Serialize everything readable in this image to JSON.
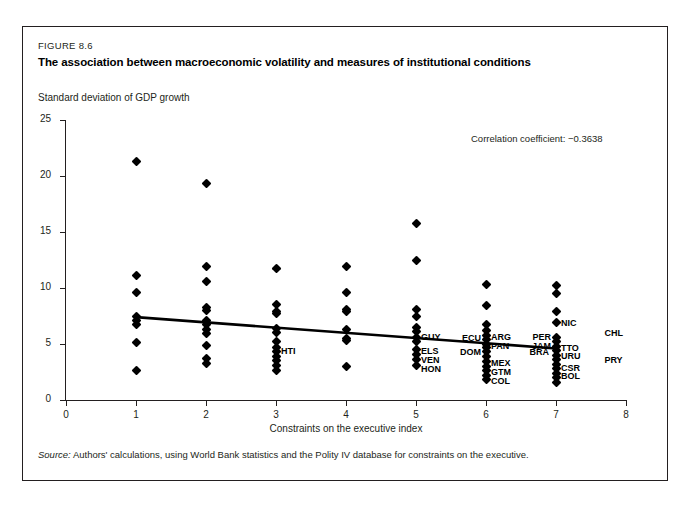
{
  "figure": {
    "number": "FIGURE 8.6",
    "title": "The association between macroeconomic volatility and measures of institutional conditions",
    "source": "Authors' calculations, using World Bank statistics and the Polity IV database for constraints on the executive.",
    "source_label": "Source:"
  },
  "chart_data": {
    "type": "scatter",
    "title": "The association between macroeconomic volatility and measures of institutional conditions",
    "subtitle": "",
    "xlabel": "Constraints on the executive index",
    "ylabel": "Standard deviation of GDP growth",
    "xlim": [
      0,
      8
    ],
    "ylim": [
      0,
      25
    ],
    "xticks": [
      0,
      1,
      2,
      3,
      4,
      5,
      6,
      7,
      8
    ],
    "yticks": [
      0,
      5,
      10,
      15,
      20,
      25
    ],
    "grid": false,
    "legend": "none",
    "annotation": "Correlation coefficient: −0.3638",
    "correlation_coefficient": -0.3638,
    "marker": "diamond",
    "marker_color": "#000000",
    "trendline": {
      "type": "linear",
      "x": [
        1,
        7
      ],
      "y": [
        7.4,
        4.6
      ],
      "color": "#000000"
    },
    "points": [
      {
        "x": 1,
        "y": 21.3
      },
      {
        "x": 1,
        "y": 11.1
      },
      {
        "x": 1,
        "y": 9.6
      },
      {
        "x": 1,
        "y": 7.5
      },
      {
        "x": 1,
        "y": 7.1
      },
      {
        "x": 1,
        "y": 6.7
      },
      {
        "x": 1,
        "y": 5.1
      },
      {
        "x": 1,
        "y": 2.6
      },
      {
        "x": 2,
        "y": 19.3
      },
      {
        "x": 2,
        "y": 11.9
      },
      {
        "x": 2,
        "y": 10.6
      },
      {
        "x": 2,
        "y": 8.3
      },
      {
        "x": 2,
        "y": 8.0
      },
      {
        "x": 2,
        "y": 7.1
      },
      {
        "x": 2,
        "y": 6.7
      },
      {
        "x": 2,
        "y": 6.3
      },
      {
        "x": 2,
        "y": 5.9
      },
      {
        "x": 2,
        "y": 4.9
      },
      {
        "x": 2,
        "y": 3.7
      },
      {
        "x": 2,
        "y": 3.3
      },
      {
        "x": 3,
        "y": 11.7
      },
      {
        "x": 3,
        "y": 8.5
      },
      {
        "x": 3,
        "y": 7.9
      },
      {
        "x": 3,
        "y": 7.7
      },
      {
        "x": 3,
        "y": 6.4
      },
      {
        "x": 3,
        "y": 6.0
      },
      {
        "x": 3,
        "y": 5.2
      },
      {
        "x": 3,
        "y": 4.7
      },
      {
        "x": 3,
        "y": 4.3
      },
      {
        "x": 3,
        "y": 3.9
      },
      {
        "x": 3,
        "y": 3.5
      },
      {
        "x": 3,
        "y": 3.1
      },
      {
        "x": 3,
        "y": 2.6
      },
      {
        "x": 4,
        "y": 11.9
      },
      {
        "x": 4,
        "y": 9.6
      },
      {
        "x": 4,
        "y": 8.1
      },
      {
        "x": 4,
        "y": 7.9
      },
      {
        "x": 4,
        "y": 6.3
      },
      {
        "x": 4,
        "y": 5.5
      },
      {
        "x": 4,
        "y": 5.3
      },
      {
        "x": 4,
        "y": 3.0
      },
      {
        "x": 5,
        "y": 15.8
      },
      {
        "x": 5,
        "y": 12.5
      },
      {
        "x": 5,
        "y": 8.1
      },
      {
        "x": 5,
        "y": 7.5
      },
      {
        "x": 5,
        "y": 6.5
      },
      {
        "x": 5,
        "y": 6.1
      },
      {
        "x": 5,
        "y": 5.6
      },
      {
        "x": 5,
        "y": 5.2
      },
      {
        "x": 5,
        "y": 4.5
      },
      {
        "x": 5,
        "y": 4.1
      },
      {
        "x": 5,
        "y": 3.6
      },
      {
        "x": 5,
        "y": 3.1
      },
      {
        "x": 6,
        "y": 10.3
      },
      {
        "x": 6,
        "y": 8.4
      },
      {
        "x": 6,
        "y": 6.7
      },
      {
        "x": 6,
        "y": 6.2
      },
      {
        "x": 6,
        "y": 5.8
      },
      {
        "x": 6,
        "y": 5.4
      },
      {
        "x": 6,
        "y": 5.0
      },
      {
        "x": 6,
        "y": 4.7
      },
      {
        "x": 6,
        "y": 4.3
      },
      {
        "x": 6,
        "y": 3.9
      },
      {
        "x": 6,
        "y": 3.4
      },
      {
        "x": 6,
        "y": 3.0
      },
      {
        "x": 6,
        "y": 2.6
      },
      {
        "x": 6,
        "y": 2.2
      },
      {
        "x": 6,
        "y": 1.8
      },
      {
        "x": 7,
        "y": 10.2
      },
      {
        "x": 7,
        "y": 9.5
      },
      {
        "x": 7,
        "y": 7.9
      },
      {
        "x": 7,
        "y": 6.9
      },
      {
        "x": 7,
        "y": 5.6
      },
      {
        "x": 7,
        "y": 5.2
      },
      {
        "x": 7,
        "y": 4.8
      },
      {
        "x": 7,
        "y": 4.4
      },
      {
        "x": 7,
        "y": 4.0
      },
      {
        "x": 7,
        "y": 3.6
      },
      {
        "x": 7,
        "y": 3.2
      },
      {
        "x": 7,
        "y": 2.8
      },
      {
        "x": 7,
        "y": 2.4
      },
      {
        "x": 7,
        "y": 2.0
      },
      {
        "x": 7,
        "y": 1.6
      }
    ],
    "country_labels": [
      {
        "code": "HTI",
        "x": 3,
        "y": 4.4,
        "align": "right"
      },
      {
        "code": "GUY",
        "x": 5,
        "y": 5.6,
        "align": "right"
      },
      {
        "code": "ELS",
        "x": 5,
        "y": 4.4,
        "align": "right"
      },
      {
        "code": "VEN",
        "x": 5,
        "y": 3.6,
        "align": "right"
      },
      {
        "code": "HON",
        "x": 5,
        "y": 2.8,
        "align": "right"
      },
      {
        "code": "ECU",
        "x": 6,
        "y": 5.5,
        "align": "left"
      },
      {
        "code": "DOM",
        "x": 6,
        "y": 4.3,
        "align": "left"
      },
      {
        "code": "ARG",
        "x": 6,
        "y": 5.6,
        "align": "right"
      },
      {
        "code": "PAN",
        "x": 6,
        "y": 4.8,
        "align": "right"
      },
      {
        "code": "BRA",
        "x": 6.55,
        "y": 4.3,
        "align": "right"
      },
      {
        "code": "MEX",
        "x": 6,
        "y": 3.3,
        "align": "right"
      },
      {
        "code": "GTM",
        "x": 6,
        "y": 2.5,
        "align": "right"
      },
      {
        "code": "COL",
        "x": 6,
        "y": 1.7,
        "align": "right"
      },
      {
        "code": "PER",
        "x": 7,
        "y": 5.6,
        "align": "left"
      },
      {
        "code": "JAM",
        "x": 7,
        "y": 4.8,
        "align": "left"
      },
      {
        "code": "NIC",
        "x": 7,
        "y": 6.9,
        "align": "right"
      },
      {
        "code": "TTO",
        "x": 7,
        "y": 4.6,
        "align": "right"
      },
      {
        "code": "URU",
        "x": 7,
        "y": 3.9,
        "align": "right"
      },
      {
        "code": "CSR",
        "x": 7,
        "y": 2.9,
        "align": "right"
      },
      {
        "code": "BOL",
        "x": 7,
        "y": 2.1,
        "align": "right"
      },
      {
        "code": "CHL",
        "x": 7.62,
        "y": 6.0,
        "align": "right"
      },
      {
        "code": "PRY",
        "x": 7.62,
        "y": 3.6,
        "align": "right"
      }
    ]
  }
}
